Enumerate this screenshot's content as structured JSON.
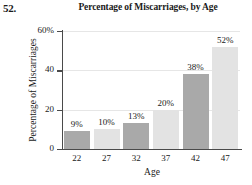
{
  "problem_number": "52.",
  "chart_data": {
    "type": "bar",
    "title": "Percentage of Miscarriages, by Age",
    "xlabel": "Age",
    "ylabel": "Percentage of Miscarriages",
    "categories": [
      "22",
      "27",
      "32",
      "37",
      "42",
      "47"
    ],
    "values": [
      9,
      10,
      13,
      20,
      38,
      52
    ],
    "data_labels": [
      "9%",
      "10%",
      "13%",
      "20%",
      "38%",
      "52%"
    ],
    "ylim": [
      0,
      60
    ],
    "yticks": [
      0,
      20,
      40,
      60
    ],
    "ytick_labels": [
      "0",
      "20",
      "40",
      "60%"
    ],
    "grid": true,
    "legend": "none",
    "bar_colors": [
      "#a9a9a9",
      "#e3e3e3",
      "#a9a9a9",
      "#e3e3e3",
      "#a9a9a9",
      "#e3e3e3"
    ],
    "axis_color": "#4a4a4a",
    "gridline_color": "#e6e6e6"
  }
}
